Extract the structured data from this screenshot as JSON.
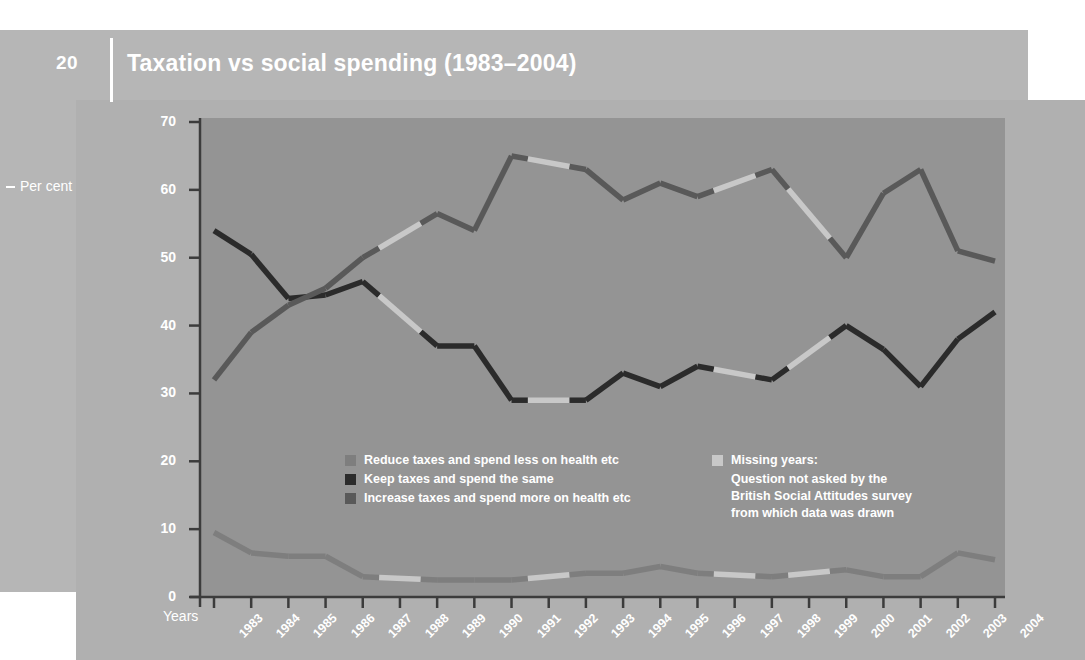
{
  "page": {
    "number": "20"
  },
  "header": {
    "title": "Taxation vs social spending (1983–2004)"
  },
  "axes": {
    "y_title": "Per cent",
    "x_title": "Years",
    "y_ticks": [
      "0",
      "10",
      "20",
      "30",
      "40",
      "50",
      "60",
      "70"
    ],
    "x_ticks": [
      "1983",
      "1984",
      "1985",
      "1986",
      "1987",
      "1988",
      "1989",
      "1990",
      "1991",
      "1992",
      "1993",
      "1994",
      "1995",
      "1996",
      "1997",
      "1998",
      "1999",
      "2000",
      "2001",
      "2002",
      "2003",
      "2004"
    ]
  },
  "legend": {
    "series": [
      {
        "label": "Reduce taxes and spend less on health etc",
        "color": "#7e7e7e",
        "swatch": "legend-swatch-reduce"
      },
      {
        "label": "Keep taxes and spend the same",
        "color": "#2b2b2b",
        "swatch": "legend-swatch-keep"
      },
      {
        "label": "Increase taxes and spend more on health etc",
        "color": "#595959",
        "swatch": "legend-swatch-increase"
      }
    ],
    "missing": {
      "swatch_color": "#c8c8c8",
      "line1": "Missing years:",
      "line2": "Question not asked by the",
      "line3": "British Social Attitudes survey",
      "line4": "from which data was drawn"
    }
  },
  "colors": {
    "panel_back": "#b6b6b6",
    "panel_mid": "#b0b0b0",
    "plot_bg": "#949494",
    "axis": "#3c3c3c",
    "text_light": "#ffffff",
    "missing_segment": "#c8c8c8"
  },
  "chart_data": {
    "type": "line",
    "title": "Taxation vs social spending (1983–2004)",
    "xlabel": "Years",
    "ylabel": "Per cent",
    "ylim": [
      0,
      70
    ],
    "xlim": [
      "1983",
      "2004"
    ],
    "grid": false,
    "legend_position": "inside-bottom",
    "x": [
      "1983",
      "1984",
      "1985",
      "1986",
      "1987",
      "1988",
      "1989",
      "1990",
      "1991",
      "1992",
      "1993",
      "1994",
      "1995",
      "1996",
      "1997",
      "1998",
      "1999",
      "2000",
      "2001",
      "2002",
      "2003",
      "2004"
    ],
    "missing_years": [
      "1988",
      "1992",
      "1997",
      "1999"
    ],
    "series": [
      {
        "name": "Increase taxes and spend more on health etc",
        "color": "#595959",
        "values": [
          32,
          39,
          43,
          45.5,
          50,
          null,
          56.5,
          54,
          65,
          null,
          63,
          58.5,
          61,
          59,
          null,
          63,
          null,
          50,
          59.5,
          63,
          51,
          49.5
        ]
      },
      {
        "name": "Keep taxes and spend the same",
        "color": "#2b2b2b",
        "values": [
          54,
          50.5,
          44,
          44.5,
          46.5,
          null,
          37,
          37,
          29,
          null,
          29,
          33,
          31,
          34,
          null,
          32,
          null,
          40,
          36.5,
          31,
          38,
          42
        ]
      },
      {
        "name": "Reduce taxes and spend less on health etc",
        "color": "#7e7e7e",
        "values": [
          9.5,
          6.5,
          6,
          6,
          3,
          null,
          2.5,
          2.5,
          2.5,
          null,
          3.5,
          3.5,
          4.5,
          3.5,
          null,
          3,
          null,
          4,
          3,
          3,
          6.5,
          5.5
        ]
      }
    ]
  }
}
